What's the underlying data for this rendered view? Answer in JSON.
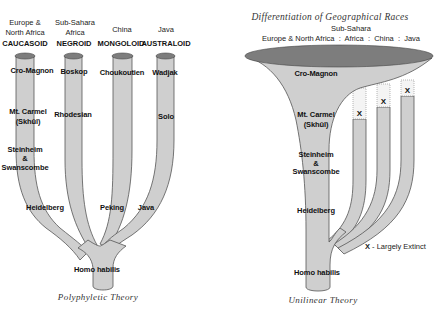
{
  "polyphyletic": {
    "caption": "Polyphyletic Theory",
    "columns": [
      {
        "region_line1": "Europe &",
        "region_line2": "North Africa",
        "race": "CAUCASOID",
        "top": "Cro-Magnon",
        "mid1": "Mt. Carmel",
        "mid2": "(Skhūl)",
        "low1": "Steinheim",
        "low2": "&",
        "low3": "Swanscombe",
        "base": "Heidelberg"
      },
      {
        "region_line1": "Sub-Sahara",
        "region_line2": "Africa",
        "race": "NEGROID",
        "top": "Boskop",
        "mid1": "Rhodesian",
        "base": ""
      },
      {
        "region_line1": "",
        "region_line2": "China",
        "race": "MONGOLOID",
        "top": "Choukoutien",
        "base": "Peking"
      },
      {
        "region_line1": "",
        "region_line2": "Java",
        "race": "AUSTRALOID",
        "top": "Wadjak",
        "mid1": "Solo",
        "base": "Java"
      }
    ],
    "root": "Homo habilis"
  },
  "unilinear": {
    "caption": "Unilinear Theory",
    "title": "Differentiation of Geographical Races",
    "header_line1": "Sub-Sahara",
    "header_line2": "Europe & North Africa  :  Africa  :  China  :  Java",
    "stages": {
      "top": "Cro-Magnon",
      "mid1": "Mt. Carmel",
      "mid2": "(Skhūl)",
      "low1": "Steinheim",
      "low2": "&",
      "low3": "Swanscombe",
      "base": "Heidelberg",
      "root": "Homo habilis"
    },
    "extinct_marker": "X",
    "legend_x": "X",
    "legend_text": " - Largely Extinct"
  }
}
